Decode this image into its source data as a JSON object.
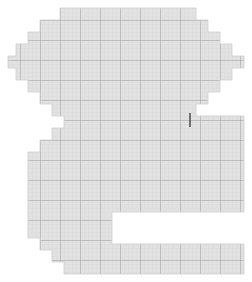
{
  "figure": {
    "width": 252,
    "height": 282,
    "background_color": "#ffffff"
  },
  "grid": {
    "minor_spacing": 4,
    "major_spacing": 20,
    "minor_line_color": "#d8d8d8",
    "major_line_color": "#9a9a9a",
    "minor_line_width": 0.7,
    "major_line_width": 1.0,
    "fill_color": "#e2e2e2",
    "outline_color": "#cfcfcf",
    "outline_width": 0.8
  },
  "marker": {
    "name": "tick-mark",
    "color": "#555555",
    "x": 190,
    "y_top": 113,
    "y_bottom": 127,
    "width": 1.6
  },
  "shape": {
    "name": "numeral-two-raster",
    "polygon_points": "72,8 196,8 196,20 208,20 208,32 220,32 220,44 232,44 232,56 244,56 244,68 232,68 232,80 220,80 220,92 208,92 208,104 196,104 196,116 244,116 244,212 112,212 112,244 244,244 244,274 64,274 64,262 52,262 52,250 40,250 40,238 28,238 28,152 40,152 40,140 52,140 52,128 64,128 64,116 52,116 52,104 40,104 40,92 28,92 28,80 16,80 16,68 8,68 8,56 16,56 16,44 28,44 28,32 40,32 40,20 60,20 60,8",
    "bounds": {
      "left": 8,
      "top": 8,
      "right": 244,
      "bottom": 274
    }
  }
}
